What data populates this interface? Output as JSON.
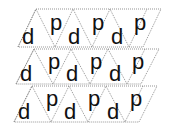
{
  "worksheet": {
    "rows": [
      {
        "letters": [
          "d",
          "p",
          "d",
          "p",
          "d",
          "p"
        ]
      },
      {
        "letters": [
          "d",
          "p",
          "d",
          "p",
          "d",
          "p"
        ]
      },
      {
        "letters": [
          "d",
          "p",
          "d",
          "p",
          "d",
          "p"
        ]
      }
    ]
  },
  "colors": {
    "line": "#666666",
    "letter": "#111111",
    "background": "#ffffff"
  }
}
